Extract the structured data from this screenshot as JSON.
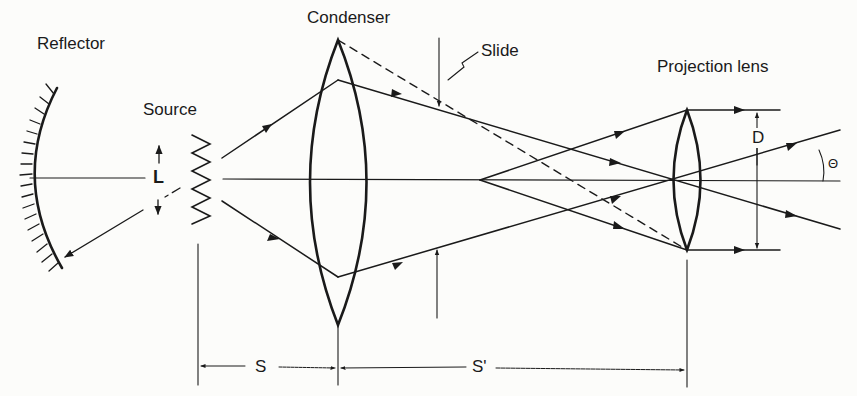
{
  "labels": {
    "reflector": "Reflector",
    "source": "Source",
    "condenser": "Condenser",
    "slide": "Slide",
    "projection_lens": "Projection lens",
    "L": "L",
    "D": "D",
    "theta": "Θ",
    "S": "S",
    "S_prime": "S'"
  },
  "colors": {
    "ink": "#1a1a1a",
    "background": "#fcfcfa"
  }
}
